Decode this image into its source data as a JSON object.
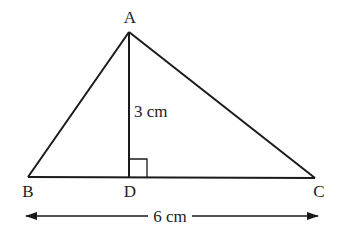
{
  "diagram": {
    "type": "triangle",
    "vertices": {
      "A": {
        "label": "A",
        "x": 129,
        "y": 32
      },
      "B": {
        "label": "B",
        "x": 28,
        "y": 177
      },
      "C": {
        "label": "C",
        "x": 315,
        "y": 178
      },
      "D": {
        "label": "D",
        "x": 129,
        "y": 177
      }
    },
    "labels": {
      "A": "A",
      "B": "B",
      "C": "C",
      "D": "D",
      "height": "3 cm",
      "base": "6 cm"
    },
    "right_angle_at": "D",
    "colors": {
      "stroke": "#1a1a1a",
      "text": "#222222",
      "background": "#ffffff"
    }
  }
}
